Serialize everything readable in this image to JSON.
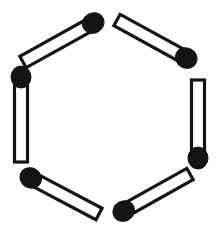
{
  "figure": {
    "width": 218,
    "height": 238,
    "background_color": "#ffffff",
    "stroke_color": "#141414",
    "head_color": "#141414",
    "body_fill_color": "#ffffff",
    "stick_count": 6,
    "stick_width": 13,
    "head_radius_x": 11,
    "head_radius_y": 10,
    "outline_width": 3.2
  },
  "matchsticks": [
    {
      "name": "matchstick-top-left",
      "position": "top-left",
      "angle_deg": -29,
      "tail": {
        "x": 23,
        "y": 62
      },
      "head": {
        "x": 95,
        "y": 22
      },
      "head_end": "upper-right"
    },
    {
      "name": "matchstick-top-right",
      "position": "top-right",
      "angle_deg": 29,
      "tail": {
        "x": 117,
        "y": 20
      },
      "head": {
        "x": 188,
        "y": 59
      },
      "head_end": "lower-right"
    },
    {
      "name": "matchstick-right",
      "position": "right",
      "angle_deg": 90,
      "tail": {
        "x": 198,
        "y": 80
      },
      "head": {
        "x": 198,
        "y": 160
      },
      "head_end": "bottom"
    },
    {
      "name": "matchstick-bottom-right",
      "position": "bottom-right",
      "angle_deg": 151,
      "tail": {
        "x": 190,
        "y": 174
      },
      "head": {
        "x": 122,
        "y": 212
      },
      "head_end": "lower-left"
    },
    {
      "name": "matchstick-bottom-left",
      "position": "bottom-left",
      "angle_deg": 209,
      "tail": {
        "x": 99,
        "y": 214
      },
      "head": {
        "x": 29,
        "y": 177
      },
      "head_end": "upper-left"
    },
    {
      "name": "matchstick-left",
      "position": "left",
      "angle_deg": 270,
      "tail": {
        "x": 21,
        "y": 162
      },
      "head": {
        "x": 21,
        "y": 75
      },
      "head_end": "top"
    }
  ]
}
